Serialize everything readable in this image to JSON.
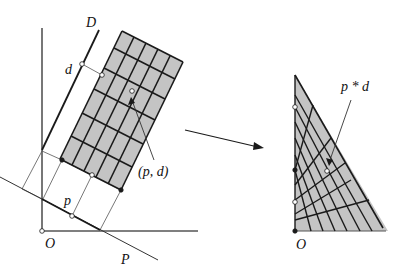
{
  "left_diagram": {
    "labels": {
      "D": "D",
      "d": "d",
      "p": "p",
      "pd": "(p, d)",
      "O": "O",
      "P": "P"
    }
  },
  "right_diagram": {
    "labels": {
      "pstar": "p * d",
      "O": "O"
    }
  },
  "colors": {
    "ink": "#1a1a1a",
    "grid_fill": "#c4c4c4",
    "outline": "#555555"
  }
}
